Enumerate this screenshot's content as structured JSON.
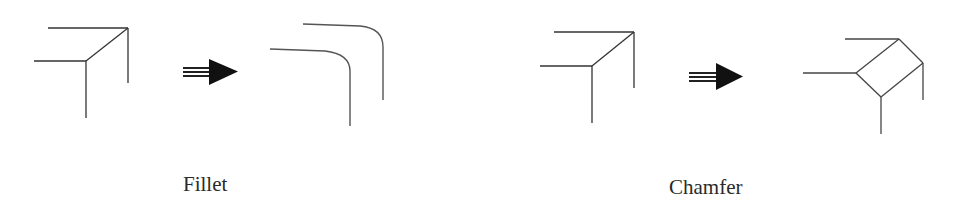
{
  "diagram": {
    "panels": [
      {
        "id": "fillet",
        "label": "Fillet",
        "before": "sharp corner (3 edges meeting at vertex)",
        "operation_arrow": "right-arrow",
        "after": "rounded corner edges"
      },
      {
        "id": "chamfer",
        "label": "Chamfer",
        "before": "sharp corner (3 edges meeting at vertex)",
        "operation_arrow": "right-arrow",
        "after": "beveled corner with flat face"
      }
    ],
    "colors": {
      "background": "#ffffff",
      "line": "#333333",
      "arrow": "#111111",
      "text": "#2a2a2a"
    }
  }
}
